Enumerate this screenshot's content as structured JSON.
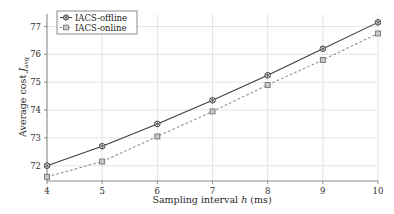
{
  "chart_data": {
    "type": "line",
    "title": "",
    "subtitle": "",
    "xlabel": "Sampling interval h (ms)",
    "ylabel": "Average cost J_avg",
    "xlabel_parts": {
      "pre": "Sampling interval ",
      "var": "h",
      "post": " (ms)"
    },
    "ylabel_parts": {
      "pre": "Average cost ",
      "var": "J",
      "sub": "avg"
    },
    "x": [
      4,
      5,
      6,
      7,
      8,
      9,
      10
    ],
    "xlim": [
      4,
      10
    ],
    "ylim": [
      71.45,
      77.45
    ],
    "xticks": [
      "4",
      "5",
      "6",
      "7",
      "8",
      "9",
      "10"
    ],
    "yticks": [
      "72",
      "73",
      "74",
      "75",
      "76",
      "77"
    ],
    "ytick_values": [
      72,
      73,
      74,
      75,
      76,
      77
    ],
    "grid": true,
    "grid_color": "#d9d9d9",
    "axis_color": "#808080",
    "legend_position": "top-left",
    "series": [
      {
        "name": "IACS-offline",
        "values": [
          72.0,
          72.7,
          73.5,
          74.35,
          75.25,
          76.2,
          77.15
        ],
        "line_style": "solid",
        "marker": "circle-asterisk",
        "color": "#3c3c3c",
        "marker_face": "#ffffff"
      },
      {
        "name": "IACS-online",
        "values": [
          71.6,
          72.15,
          73.05,
          73.95,
          74.9,
          75.8,
          76.75
        ],
        "line_style": "dashed",
        "marker": "square",
        "color": "#8a8a8a",
        "marker_face": "#c8c8c8"
      }
    ]
  },
  "legend": {
    "entries": [
      {
        "label": "IACS-offline"
      },
      {
        "label": "IACS-online"
      }
    ]
  }
}
